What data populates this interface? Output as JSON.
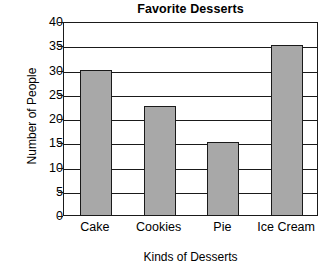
{
  "chart_data": {
    "type": "bar",
    "title": "Favorite Desserts",
    "xlabel": "Kinds of Desserts",
    "ylabel": "Number of People",
    "categories": [
      "Cake",
      "Cookies",
      "Pie",
      "Ice Cream"
    ],
    "values": [
      30,
      22.5,
      15,
      35
    ],
    "ylim": [
      0,
      40
    ],
    "ytick_step": 5,
    "yticks": [
      0,
      5,
      10,
      15,
      20,
      25,
      30,
      35,
      40
    ],
    "ytick_labels": [
      "0",
      "5",
      "10",
      "15",
      "20",
      "25",
      "30",
      "35",
      "40"
    ],
    "grid": true,
    "grid_axis": "y",
    "legend": false,
    "legend_position": "none",
    "bar_fill_color": "#a8a8a8",
    "bar_edge_color": "#1a1a1a",
    "plot_background_color": "#ffffff",
    "axis_color": "#1a1a1a",
    "text_color": "#000000"
  }
}
